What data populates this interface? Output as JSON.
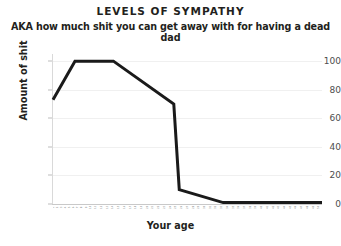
{
  "chart_data": {
    "type": "line",
    "title": "LEVELS OF SYMPATHY",
    "subtitle": "AKA how much shit you can get away with for having a dead dad",
    "xlabel": "Your age",
    "ylabel": "Amount of shit",
    "xlim": [
      0,
      49
    ],
    "ylim": [
      0,
      105
    ],
    "yticks": [
      0,
      20,
      40,
      60,
      80,
      100
    ],
    "ytick_labels": [
      "0",
      "20",
      "40",
      "60",
      "80",
      "100"
    ],
    "grid": "horizontal",
    "legend": "none",
    "line_color": "#1a1a1a",
    "line_width": 3,
    "xtick_labels": [
      "1",
      "2",
      "3",
      "4",
      "5",
      "6",
      "7",
      "8",
      "9",
      "10",
      "11",
      "12",
      "13",
      "14",
      "15",
      "16",
      "17",
      "18",
      "19",
      "20",
      "21",
      "22",
      "23",
      "24",
      "25",
      "26",
      "27",
      "28",
      "29",
      "30",
      "31",
      "32",
      "33",
      "34",
      "35",
      "36",
      "37",
      "38",
      "39",
      "40",
      "41",
      "42",
      "43",
      "44",
      "45",
      "46",
      "47",
      "48",
      "49",
      "50"
    ],
    "x": [
      0,
      4,
      11,
      22,
      23,
      31,
      49
    ],
    "values": [
      73,
      100,
      100,
      70,
      10,
      1,
      1
    ],
    "series": [
      {
        "name": "Amount of shit",
        "points": [
          {
            "x": 0,
            "y": 73
          },
          {
            "x": 4,
            "y": 100
          },
          {
            "x": 11,
            "y": 100
          },
          {
            "x": 22,
            "y": 70
          },
          {
            "x": 23,
            "y": 10
          },
          {
            "x": 31,
            "y": 1
          },
          {
            "x": 49,
            "y": 1
          }
        ]
      }
    ]
  }
}
